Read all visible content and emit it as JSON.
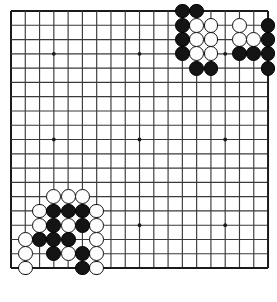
{
  "app": {
    "title": "Go Board Position",
    "background_color": "#ffffff"
  },
  "board": {
    "name": "go-board",
    "size": 19,
    "line_color": "#3a3a3a",
    "border_color": "#1a1a1a",
    "background_color": "#ffffff",
    "origin_x": 11,
    "origin_y": 11,
    "spacing": 14.28,
    "stone_radius": 7.4,
    "star_point_radius": 1.9,
    "star_points": [
      {
        "col": 4,
        "row": 4
      },
      {
        "col": 10,
        "row": 4
      },
      {
        "col": 16,
        "row": 4
      },
      {
        "col": 4,
        "row": 10
      },
      {
        "col": 10,
        "row": 10
      },
      {
        "col": 16,
        "row": 10
      },
      {
        "col": 4,
        "row": 16
      },
      {
        "col": 10,
        "row": 16
      },
      {
        "col": 16,
        "row": 16
      }
    ]
  },
  "stones": {
    "black_color": "#141414",
    "white_color": "#fdfdfd",
    "black": [
      {
        "col": 13,
        "row": 1
      },
      {
        "col": 14,
        "row": 1
      },
      {
        "col": 13,
        "row": 2
      },
      {
        "col": 19,
        "row": 2
      },
      {
        "col": 13,
        "row": 3
      },
      {
        "col": 19,
        "row": 3
      },
      {
        "col": 13,
        "row": 4
      },
      {
        "col": 17,
        "row": 4
      },
      {
        "col": 18,
        "row": 4
      },
      {
        "col": 19,
        "row": 4
      },
      {
        "col": 14,
        "row": 5
      },
      {
        "col": 15,
        "row": 5
      },
      {
        "col": 19,
        "row": 5
      },
      {
        "col": 4,
        "row": 15
      },
      {
        "col": 5,
        "row": 15
      },
      {
        "col": 6,
        "row": 15
      },
      {
        "col": 4,
        "row": 16
      },
      {
        "col": 6,
        "row": 16
      },
      {
        "col": 3,
        "row": 17
      },
      {
        "col": 4,
        "row": 17
      },
      {
        "col": 5,
        "row": 17
      },
      {
        "col": 4,
        "row": 18
      },
      {
        "col": 6,
        "row": 18
      },
      {
        "col": 6,
        "row": 19
      }
    ],
    "white": [
      {
        "col": 14,
        "row": 2
      },
      {
        "col": 15,
        "row": 2
      },
      {
        "col": 17,
        "row": 2
      },
      {
        "col": 14,
        "row": 3
      },
      {
        "col": 15,
        "row": 3
      },
      {
        "col": 17,
        "row": 3
      },
      {
        "col": 18,
        "row": 3
      },
      {
        "col": 14,
        "row": 4
      },
      {
        "col": 15,
        "row": 4
      },
      {
        "col": 4,
        "row": 14
      },
      {
        "col": 5,
        "row": 14
      },
      {
        "col": 6,
        "row": 14
      },
      {
        "col": 3,
        "row": 15
      },
      {
        "col": 7,
        "row": 15
      },
      {
        "col": 3,
        "row": 16
      },
      {
        "col": 5,
        "row": 16
      },
      {
        "col": 7,
        "row": 16
      },
      {
        "col": 2,
        "row": 17
      },
      {
        "col": 7,
        "row": 17
      },
      {
        "col": 2,
        "row": 18
      },
      {
        "col": 5,
        "row": 18
      },
      {
        "col": 7,
        "row": 18
      },
      {
        "col": 2,
        "row": 19
      },
      {
        "col": 7,
        "row": 19
      }
    ]
  }
}
